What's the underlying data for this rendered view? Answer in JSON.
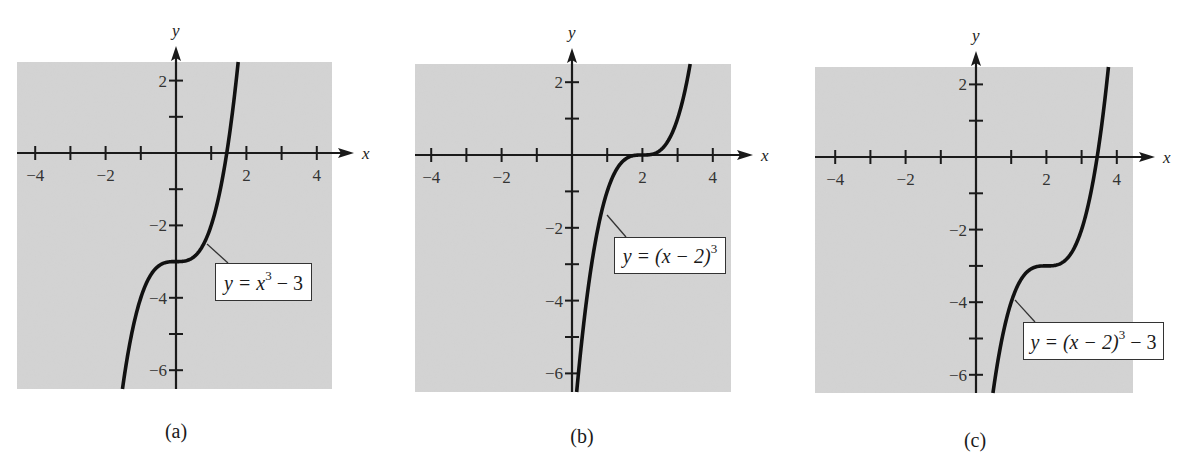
{
  "chart_data": [
    {
      "type": "line",
      "panel": "(a)",
      "equation": "y = x^3 - 3",
      "label": {
        "pre": "y = x",
        "sup": "3",
        "post": " − 3"
      },
      "xlabel": "x",
      "ylabel": "y",
      "xlim": [
        -4.5,
        4.5
      ],
      "ylim": [
        -6.6,
        2.5
      ],
      "x_ticks": [
        -4,
        -3,
        -2,
        -1,
        1,
        2,
        3,
        4
      ],
      "x_tick_labels": [
        "−4",
        "−2",
        "2",
        "4"
      ],
      "x_tick_label_values": [
        -4,
        -2,
        2,
        4
      ],
      "y_ticks": [
        2,
        1,
        -1,
        -2,
        -3,
        -4,
        -5,
        -6
      ],
      "y_tick_labels": [
        "2",
        "−2",
        "−4",
        "−6"
      ],
      "y_tick_label_values": [
        2,
        -2,
        -4,
        -6
      ],
      "shift": {
        "h": 0,
        "k": -3
      },
      "key_points": [
        {
          "x": 0,
          "y": -3,
          "note": "inflection"
        },
        {
          "x": 1.442,
          "y": 0,
          "note": "x-intercept"
        }
      ],
      "grid": false
    },
    {
      "type": "line",
      "panel": "(b)",
      "equation": "y = (x - 2)^3",
      "label": {
        "pre": "y = (x − 2)",
        "sup": "3",
        "post": ""
      },
      "xlabel": "x",
      "ylabel": "y",
      "xlim": [
        -4.5,
        4.5
      ],
      "ylim": [
        -6.6,
        2.5
      ],
      "x_ticks": [
        -4,
        -3,
        -2,
        -1,
        1,
        2,
        3,
        4
      ],
      "x_tick_labels": [
        "−4",
        "−2",
        "2",
        "4"
      ],
      "x_tick_label_values": [
        -4,
        -2,
        2,
        4
      ],
      "y_ticks": [
        2,
        1,
        -1,
        -2,
        -3,
        -4,
        -5,
        -6
      ],
      "y_tick_labels": [
        "2",
        "−2",
        "−4",
        "−6"
      ],
      "y_tick_label_values": [
        2,
        -2,
        -4,
        -6
      ],
      "shift": {
        "h": 2,
        "k": 0
      },
      "key_points": [
        {
          "x": 2,
          "y": 0,
          "note": "inflection / x-intercept"
        }
      ],
      "grid": false
    },
    {
      "type": "line",
      "panel": "(c)",
      "equation": "y = (x - 2)^3 - 3",
      "label": {
        "pre": "y = (x − 2)",
        "sup": "3",
        "post": " − 3"
      },
      "xlabel": "x",
      "ylabel": "y",
      "xlim": [
        -4.5,
        4.5
      ],
      "ylim": [
        -6.6,
        2.5
      ],
      "x_ticks": [
        -4,
        -3,
        -2,
        -1,
        1,
        2,
        3,
        4
      ],
      "x_tick_labels": [
        "−4",
        "−2",
        "2",
        "4"
      ],
      "x_tick_label_values": [
        -4,
        -2,
        2,
        4
      ],
      "y_ticks": [
        2,
        1,
        -1,
        -2,
        -3,
        -4,
        -5,
        -6
      ],
      "y_tick_labels": [
        "2",
        "−2",
        "−4",
        "−6"
      ],
      "y_tick_label_values": [
        2,
        -2,
        -4,
        -6
      ],
      "shift": {
        "h": 2,
        "k": -3
      },
      "key_points": [
        {
          "x": 2,
          "y": -3,
          "note": "inflection"
        },
        {
          "x": 3.442,
          "y": 0,
          "note": "x-intercept"
        }
      ],
      "grid": false
    }
  ],
  "panels": [
    {
      "caption": "(a)",
      "axis_x": "x",
      "axis_y": "y"
    },
    {
      "caption": "(b)",
      "axis_x": "x",
      "axis_y": "y"
    },
    {
      "caption": "(c)",
      "axis_x": "x",
      "axis_y": "y"
    }
  ],
  "colors": {
    "plot_background": "#d4d4d4",
    "curve": "#111111",
    "axis": "#1a1a1a",
    "label_box_bg": "#ffffff",
    "page_background": "#ffffff"
  }
}
